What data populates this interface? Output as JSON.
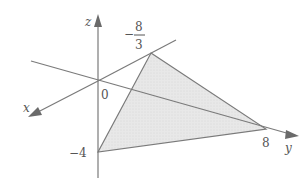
{
  "diagram": {
    "type": "3d-coordinate-plane-intercepts",
    "axes": {
      "x": "x",
      "y": "y",
      "z": "z"
    },
    "origin_label": "0",
    "intercepts": {
      "z_top_numerator": "8",
      "z_top_denominator": "3",
      "z_top_sign": "−",
      "z_bottom": "−4",
      "y": "8"
    },
    "colors": {
      "line": "#777777",
      "fill": "#e6e6e6",
      "text": "#555555"
    }
  }
}
